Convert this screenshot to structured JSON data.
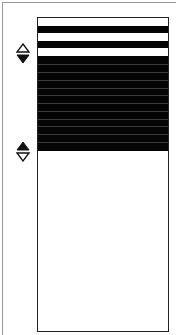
{
  "widget": {
    "type": "list-selection",
    "colors": {
      "selected": "#050505",
      "unselected": "#ffffff",
      "separator": "#3a3a3a",
      "border": "#222222"
    },
    "header_rows": [
      "white",
      "black",
      "white",
      "black",
      "white"
    ],
    "selected_rows": 12,
    "selection_start_arrows": {
      "up": "outline",
      "down": "filled"
    },
    "selection_end_arrows": {
      "up": "filled",
      "down": "outline"
    }
  }
}
